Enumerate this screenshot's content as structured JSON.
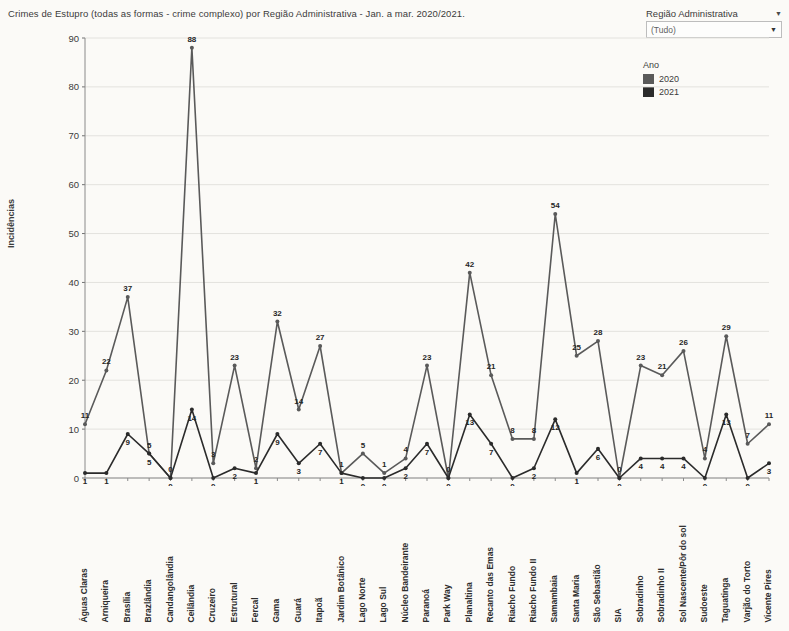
{
  "title": "Crimes de Estupro (todas as formas - crime complexo) por Região Administrativa - Jan. a mar. 2020/2021.",
  "filter": {
    "label": "Região Administrativa",
    "value": "(Tudo)",
    "caret": "▼"
  },
  "legend": {
    "title": "Ano",
    "items": [
      {
        "label": "2020",
        "color": "#5a5a5a"
      },
      {
        "label": "2021",
        "color": "#2b2b2b"
      }
    ]
  },
  "chart_data": {
    "type": "line",
    "title": "Crimes de Estupro (todas as formas - crime complexo) por Região Administrativa - Jan. a mar. 2020/2021.",
    "xlabel": "",
    "ylabel": "Incidências",
    "ylim": [
      0,
      90
    ],
    "yticks": [
      0,
      10,
      20,
      30,
      40,
      50,
      60,
      70,
      80,
      90
    ],
    "grid": true,
    "legend_position": "top-right",
    "categories": [
      "Águas Claras",
      "Arniqueira",
      "Brasília",
      "Brazlândia",
      "Candangolândia",
      "Ceilândia",
      "Cruzeiro",
      "Estrutural",
      "Fercal",
      "Gama",
      "Guará",
      "Itapoã",
      "Jardim Botânico",
      "Lago Norte",
      "Lago Sul",
      "Núcleo Bandeirante",
      "Paranoá",
      "Park Way",
      "Planaltina",
      "Recanto das Emas",
      "Riacho Fundo",
      "Riacho Fundo II",
      "Samambaia",
      "Santa Maria",
      "São Sebastião",
      "SIA",
      "Sobradinho",
      "Sobradinho II",
      "Sol Nascente/Pôr do sol",
      "Sudoeste",
      "Taguatinga",
      "Varjão do Torto",
      "Vicente Pires"
    ],
    "series": [
      {
        "name": "2020",
        "color": "#5a5a5a",
        "values": [
          11,
          22,
          37,
          5,
          0,
          88,
          3,
          23,
          2,
          32,
          14,
          27,
          1,
          5,
          1,
          4,
          23,
          0,
          42,
          21,
          8,
          8,
          54,
          25,
          28,
          0,
          23,
          21,
          26,
          4,
          29,
          7,
          11
        ]
      },
      {
        "name": "2021",
        "color": "#2b2b2b",
        "values": [
          1,
          1,
          9,
          5,
          0,
          14,
          0,
          2,
          1,
          9,
          3,
          7,
          1,
          0,
          0,
          2,
          7,
          0,
          13,
          7,
          0,
          2,
          12,
          1,
          6,
          0,
          4,
          4,
          4,
          0,
          13,
          0,
          3
        ]
      }
    ]
  }
}
